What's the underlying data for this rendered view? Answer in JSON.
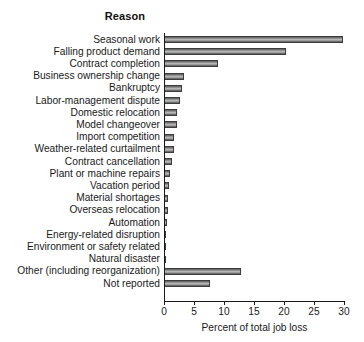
{
  "chart_data": {
    "type": "bar",
    "orientation": "horizontal",
    "title": "Reason",
    "xlabel": "Percent of total job loss",
    "ylabel": "",
    "xlim": [
      0,
      30
    ],
    "xticks": [
      0,
      5,
      10,
      15,
      20,
      25,
      30
    ],
    "xtick_labels": [
      "0",
      "5",
      "10",
      "15",
      "20",
      "25",
      "30"
    ],
    "grid": false,
    "legend": null,
    "bar_color": "#9a9a9a",
    "bar_edge_color": "#3d3d3d",
    "categories": [
      "Seasonal work",
      "Falling product demand",
      "Contract completion",
      "Business ownership change",
      "Bankruptcy",
      "Labor-management dispute",
      "Domestic relocation",
      "Model changeover",
      "Import competition",
      "Weather-related curtailment",
      "Contract cancellation",
      "Plant or machine repairs",
      "Vacation period",
      "Material shortages",
      "Overseas relocation",
      "Automation",
      "Energy-related disruption",
      "Environment or safety related",
      "Natural disaster",
      "Other (including reorganization)",
      "Not reported"
    ],
    "values": [
      29.9,
      20.3,
      9.0,
      3.4,
      3.0,
      2.7,
      2.2,
      2.1,
      1.7,
      1.6,
      1.3,
      1.0,
      0.8,
      0.7,
      0.6,
      0.5,
      0.4,
      0.3,
      0.2,
      12.8,
      7.6
    ]
  }
}
